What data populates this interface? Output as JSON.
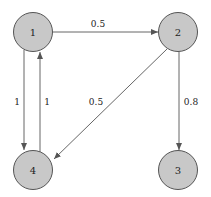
{
  "nodes": [
    {
      "id": "1",
      "label": "1",
      "x": 33,
      "y": 32
    },
    {
      "id": "2",
      "label": "2",
      "x": 178,
      "y": 32
    },
    {
      "id": "3",
      "label": "3",
      "x": 178,
      "y": 170
    },
    {
      "id": "4",
      "label": "4",
      "x": 33,
      "y": 170
    }
  ],
  "edges": [
    {
      "from": "1",
      "to": "2",
      "weight": "0.5"
    },
    {
      "from": "1",
      "to": "4",
      "weight": "1"
    },
    {
      "from": "4",
      "to": "1",
      "weight": "1"
    },
    {
      "from": "2",
      "to": "4",
      "weight": "0.5"
    },
    {
      "from": "2",
      "to": "3",
      "weight": "0.8"
    }
  ],
  "colors": {
    "node_fill": "#c8c8c8",
    "node_stroke": "#555555",
    "edge": "#666666"
  }
}
